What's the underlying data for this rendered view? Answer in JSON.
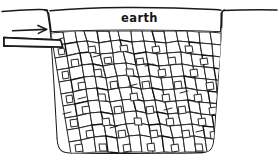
{
  "figure": {
    "title": "earth",
    "kind": "soakaway-pit-section-drawing",
    "style": "hand-drawn-line-sketch",
    "canvas": {
      "width": 279,
      "height": 165,
      "background": "#ffffff"
    },
    "ink_color": "#1a1a1a",
    "stone_stroke_color": "#2b2b2b",
    "labels": {
      "earth": "earth"
    },
    "elements": {
      "ground_surface": {
        "name": "ground-line",
        "y": 10,
        "x_start": 2,
        "x_end": 277
      },
      "pit": {
        "name": "excavated-pit",
        "left_top_x": 48,
        "right_top_x": 222,
        "top_y": 31,
        "bottom_y": 152,
        "left_bottom_x": 58,
        "right_bottom_x": 214,
        "corner_radius": 11
      },
      "inlet_pipe": {
        "name": "inlet-pipe",
        "x_start": 4,
        "x_end": 62,
        "top_y": 38,
        "bottom_y": 46
      },
      "flow_arrow": {
        "name": "flow-direction-arrow",
        "x_start": 12,
        "x_end": 48,
        "y": 30,
        "direction": "right"
      },
      "rubble_fill": {
        "name": "rubble-stone-fill",
        "description": "irregular packed stones",
        "stone_count": 196
      }
    }
  }
}
